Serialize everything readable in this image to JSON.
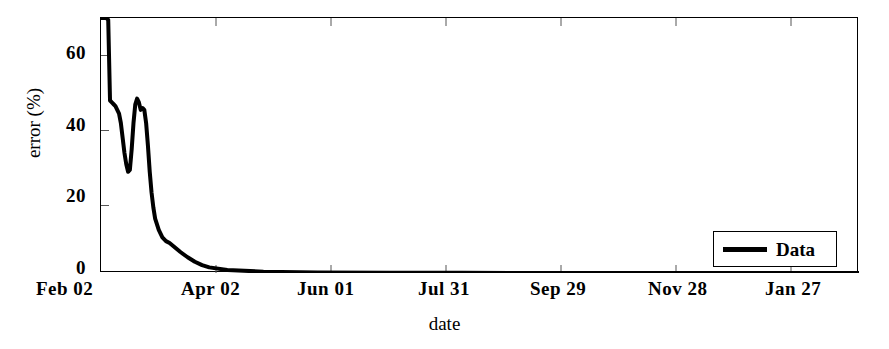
{
  "chart_data": {
    "type": "line",
    "title": "",
    "xlabel": "date",
    "ylabel": "error (%)",
    "ylim": [
      0,
      68
    ],
    "yticks": [
      0,
      20,
      40,
      60
    ],
    "ytick_labels": [
      "0",
      "20",
      "40",
      "60"
    ],
    "xtick_labels": [
      "Feb 02",
      "Apr 02",
      "Jun 01",
      "Jul 31",
      "Sep 29",
      "Nov 28",
      "Jan 27"
    ],
    "xlim_days": [
      0,
      420
    ],
    "xticks_days": [
      0,
      59,
      119,
      179,
      239,
      299,
      359
    ],
    "grid": false,
    "legend_position": "lower right",
    "series": [
      {
        "name": "Data",
        "color": "#000000",
        "linewidth": 4,
        "x": [
          0,
          1,
          2,
          3,
          4,
          5,
          6,
          7,
          8,
          9,
          10,
          11,
          12,
          13,
          14,
          15,
          16,
          17,
          18,
          19,
          20,
          21,
          22,
          23,
          24,
          25,
          26,
          27,
          28,
          29,
          30,
          32,
          34,
          36,
          38,
          40,
          44,
          48,
          52,
          56,
          60,
          70,
          90,
          120,
          160,
          200,
          260,
          320,
          380,
          420
        ],
        "values": [
          68,
          68,
          68,
          68,
          67.5,
          46,
          45.5,
          45,
          44.5,
          43.5,
          42.5,
          40,
          36,
          32,
          29,
          27,
          27.5,
          33,
          40,
          45,
          46.5,
          45.5,
          43.5,
          44,
          43.5,
          40,
          34,
          27,
          21.5,
          17.5,
          14.5,
          11.5,
          9.5,
          8.5,
          8,
          7.2,
          5.6,
          4.2,
          3.0,
          2.1,
          1.5,
          0.8,
          0.35,
          0.15,
          0.07,
          0.04,
          0.02,
          0.01,
          0.01,
          0.01
        ]
      }
    ],
    "legend_entries": [
      {
        "label": "Data",
        "color": "#000000"
      }
    ]
  },
  "axes": {
    "y_title": "error (%)",
    "x_title": "date",
    "y_tick_labels": [
      "60",
      "40",
      "20",
      "0"
    ],
    "x_tick_labels": [
      "Feb 02",
      "Apr 02",
      "Jun 01",
      "Jul 31",
      "Sep 29",
      "Nov 28",
      "Jan 27"
    ]
  },
  "legend": {
    "series_label": "Data"
  },
  "colors": {
    "line": "#000000",
    "frame": "#000000",
    "background": "#ffffff"
  }
}
